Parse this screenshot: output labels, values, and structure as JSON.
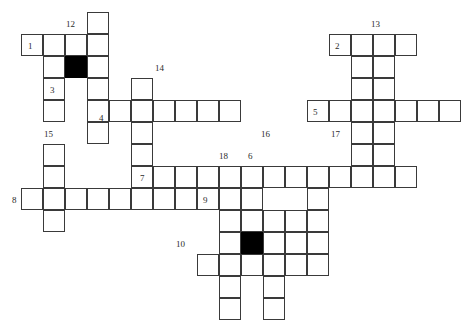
{
  "puzzle": {
    "title": "Crossword Grid",
    "grid": {
      "cell_size": 22,
      "origin_x": 21,
      "origin_y": 34,
      "line_color": "#3a3a3a",
      "cell_color": "#ffffff",
      "blocked_color": "#000000",
      "background": "#ffffff",
      "columns": 20,
      "rows": 13
    },
    "cells": [
      {
        "c": 0,
        "r": 0
      },
      {
        "c": 1,
        "r": 0
      },
      {
        "c": 2,
        "r": 0
      },
      {
        "c": 3,
        "r": 0
      },
      {
        "c": 3,
        "r": -1
      },
      {
        "c": 1,
        "r": 1
      },
      {
        "c": 2,
        "r": 1,
        "blocked": true
      },
      {
        "c": 3,
        "r": 1
      },
      {
        "c": 1,
        "r": 2
      },
      {
        "c": 3,
        "r": 2
      },
      {
        "c": 1,
        "r": 3
      },
      {
        "c": 3,
        "r": 3
      },
      {
        "c": 4,
        "r": 3
      },
      {
        "c": 5,
        "r": 3
      },
      {
        "c": 6,
        "r": 3
      },
      {
        "c": 7,
        "r": 3
      },
      {
        "c": 8,
        "r": 3
      },
      {
        "c": 9,
        "r": 3
      },
      {
        "c": 5,
        "r": 2
      },
      {
        "c": 3,
        "r": 4
      },
      {
        "c": 5,
        "r": 4
      },
      {
        "c": 5,
        "r": 5
      },
      {
        "c": 1,
        "r": 5
      },
      {
        "c": 1,
        "r": 6
      },
      {
        "c": 1,
        "r": 7
      },
      {
        "c": 1,
        "r": 8
      },
      {
        "c": 0,
        "r": 7
      },
      {
        "c": 2,
        "r": 7
      },
      {
        "c": 3,
        "r": 7
      },
      {
        "c": 4,
        "r": 7
      },
      {
        "c": 5,
        "r": 7
      },
      {
        "c": 6,
        "r": 7
      },
      {
        "c": 7,
        "r": 7
      },
      {
        "c": 8,
        "r": 7
      },
      {
        "c": 9,
        "r": 7
      },
      {
        "c": 10,
        "r": 7
      },
      {
        "c": 5,
        "r": 6
      },
      {
        "c": 6,
        "r": 6
      },
      {
        "c": 7,
        "r": 6
      },
      {
        "c": 8,
        "r": 6
      },
      {
        "c": 9,
        "r": 6
      },
      {
        "c": 10,
        "r": 6
      },
      {
        "c": 11,
        "r": 6
      },
      {
        "c": 12,
        "r": 6
      },
      {
        "c": 13,
        "r": 6
      },
      {
        "c": 14,
        "r": 6
      },
      {
        "c": 15,
        "r": 6
      },
      {
        "c": 16,
        "r": 6
      },
      {
        "c": 17,
        "r": 6
      },
      {
        "c": 9,
        "r": 8
      },
      {
        "c": 10,
        "r": 8
      },
      {
        "c": 11,
        "r": 8
      },
      {
        "c": 12,
        "r": 8
      },
      {
        "c": 10,
        "r": 9,
        "blocked": true
      },
      {
        "c": 9,
        "r": 9
      },
      {
        "c": 11,
        "r": 9
      },
      {
        "c": 12,
        "r": 9
      },
      {
        "c": 8,
        "r": 10
      },
      {
        "c": 9,
        "r": 10
      },
      {
        "c": 10,
        "r": 10
      },
      {
        "c": 11,
        "r": 10
      },
      {
        "c": 12,
        "r": 10
      },
      {
        "c": 9,
        "r": 11
      },
      {
        "c": 11,
        "r": 11
      },
      {
        "c": 9,
        "r": 12
      },
      {
        "c": 11,
        "r": 12
      },
      {
        "c": 13,
        "r": 7
      },
      {
        "c": 13,
        "r": 8
      },
      {
        "c": 13,
        "r": 9
      },
      {
        "c": 13,
        "r": 10
      },
      {
        "c": 14,
        "r": 0
      },
      {
        "c": 15,
        "r": 0
      },
      {
        "c": 16,
        "r": 0
      },
      {
        "c": 17,
        "r": 0
      },
      {
        "c": 15,
        "r": 1
      },
      {
        "c": 16,
        "r": 1
      },
      {
        "c": 15,
        "r": 2
      },
      {
        "c": 16,
        "r": 2
      },
      {
        "c": 13,
        "r": 3
      },
      {
        "c": 14,
        "r": 3
      },
      {
        "c": 15,
        "r": 3
      },
      {
        "c": 16,
        "r": 3
      },
      {
        "c": 17,
        "r": 3
      },
      {
        "c": 18,
        "r": 3
      },
      {
        "c": 19,
        "r": 3
      },
      {
        "c": 15,
        "r": 4
      },
      {
        "c": 16,
        "r": 4
      },
      {
        "c": 15,
        "r": 5
      },
      {
        "c": 16,
        "r": 5
      }
    ],
    "clue_numbers": [
      {
        "label": "1",
        "x": 28,
        "y": 41
      },
      {
        "label": "12",
        "x": 66,
        "y": 19
      },
      {
        "label": "13",
        "x": 371,
        "y": 19
      },
      {
        "label": "2",
        "x": 335,
        "y": 41
      },
      {
        "label": "3",
        "x": 50,
        "y": 85
      },
      {
        "label": "14",
        "x": 155,
        "y": 63
      },
      {
        "label": "4",
        "x": 99,
        "y": 113
      },
      {
        "label": "5",
        "x": 313,
        "y": 107
      },
      {
        "label": "15",
        "x": 44,
        "y": 129
      },
      {
        "label": "16",
        "x": 261,
        "y": 129
      },
      {
        "label": "17",
        "x": 331,
        "y": 129
      },
      {
        "label": "18",
        "x": 219,
        "y": 151
      },
      {
        "label": "6",
        "x": 248,
        "y": 151
      },
      {
        "label": "7",
        "x": 140,
        "y": 173
      },
      {
        "label": "8",
        "x": 12,
        "y": 195
      },
      {
        "label": "9",
        "x": 203,
        "y": 195
      },
      {
        "label": "10",
        "x": 176,
        "y": 239
      }
    ]
  }
}
